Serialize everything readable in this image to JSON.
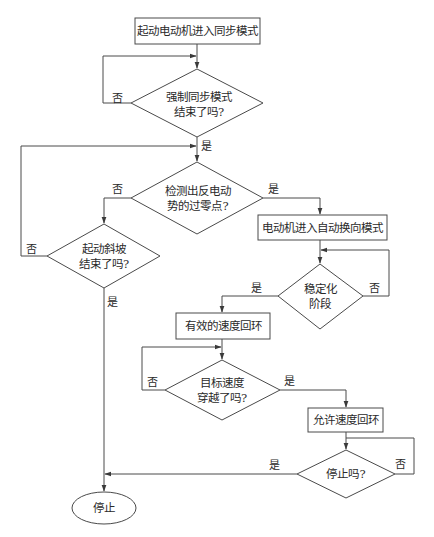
{
  "diagram": {
    "type": "flowchart",
    "colors": {
      "line": "#4a4a4a",
      "text": "#2a2a2a",
      "background": "#ffffff"
    },
    "nodes": {
      "start_sync": {
        "shape": "rect",
        "text": "起动电动机进入同步模式"
      },
      "forced_sync_done": {
        "shape": "diamond",
        "lines": [
          "强制同步模式",
          "结束了吗?"
        ]
      },
      "bemf_zero_cross": {
        "shape": "diamond",
        "lines": [
          "检测出反电动",
          "势的过零点?"
        ]
      },
      "ramp_done": {
        "shape": "diamond",
        "lines": [
          "起动斜坡",
          "结束了吗?"
        ]
      },
      "auto_commutation": {
        "shape": "rect",
        "text": "电动机进入自动换向模式"
      },
      "stabilization": {
        "shape": "diamond",
        "lines": [
          "稳定化",
          "阶段"
        ]
      },
      "speed_loop_active": {
        "shape": "rect",
        "text": "有效的速度回环"
      },
      "target_speed_crossed": {
        "shape": "diamond",
        "lines": [
          "目标速度",
          "穿越了吗?"
        ]
      },
      "enable_speed_loop": {
        "shape": "rect",
        "text": "允许速度回环"
      },
      "stop_check": {
        "shape": "diamond",
        "lines": [
          "停止吗?"
        ]
      },
      "stop": {
        "shape": "ellipse",
        "text": "停止"
      }
    },
    "edge_labels": {
      "forced_sync_no": "否",
      "forced_sync_yes": "是",
      "bemf_no": "否",
      "bemf_yes": "是",
      "ramp_no": "否",
      "ramp_yes": "是",
      "stabilization_yes": "是",
      "stabilization_no": "否",
      "target_no": "否",
      "target_yes": "是",
      "stop_yes": "是",
      "stop_no": "否"
    },
    "edges": [
      {
        "from": "start_sync",
        "to": "forced_sync_done"
      },
      {
        "from": "forced_sync_done",
        "to": "forced_sync_done",
        "label": "否"
      },
      {
        "from": "forced_sync_done",
        "to": "bemf_zero_cross",
        "label": "是"
      },
      {
        "from": "bemf_zero_cross",
        "to": "ramp_done",
        "label": "否"
      },
      {
        "from": "bemf_zero_cross",
        "to": "auto_commutation",
        "label": "是"
      },
      {
        "from": "ramp_done",
        "to": "bemf_zero_cross",
        "label": "否"
      },
      {
        "from": "ramp_done",
        "to": "stop",
        "label": "是"
      },
      {
        "from": "auto_commutation",
        "to": "stabilization"
      },
      {
        "from": "stabilization",
        "to": "stabilization",
        "label": "否"
      },
      {
        "from": "stabilization",
        "to": "speed_loop_active",
        "label": "是"
      },
      {
        "from": "speed_loop_active",
        "to": "target_speed_crossed"
      },
      {
        "from": "target_speed_crossed",
        "to": "target_speed_crossed",
        "label": "否"
      },
      {
        "from": "target_speed_crossed",
        "to": "enable_speed_loop",
        "label": "是"
      },
      {
        "from": "enable_speed_loop",
        "to": "stop_check"
      },
      {
        "from": "stop_check",
        "to": "stop_check",
        "label": "否"
      },
      {
        "from": "stop_check",
        "to": "stop",
        "label": "是"
      }
    ]
  }
}
